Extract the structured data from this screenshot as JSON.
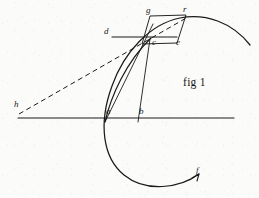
{
  "figure": {
    "caption": "fig 1",
    "ink_color": "#1a1a1a",
    "paper_color": "#fbfbfa",
    "width": 259,
    "height": 198,
    "points": [
      {
        "id": "h",
        "label": "h",
        "x": 18,
        "y": 113,
        "label_x": 14,
        "label_y": 104
      },
      {
        "id": "a",
        "label": "a",
        "x": 105,
        "y": 122,
        "label_x": 106,
        "label_y": 111
      },
      {
        "id": "b",
        "label": "b",
        "x": 138,
        "y": 122,
        "label_x": 139,
        "label_y": 111
      },
      {
        "id": "c",
        "label": "c",
        "x": 150,
        "y": 39,
        "label_x": 152,
        "label_y": 40
      },
      {
        "id": "d",
        "label": "d",
        "x": 112,
        "y": 37,
        "label_x": 105,
        "label_y": 30
      },
      {
        "id": "e",
        "label": "e",
        "x": 177,
        "y": 40,
        "label_x": 176,
        "label_y": 40
      },
      {
        "id": "g",
        "label": "g",
        "x": 150,
        "y": 16,
        "label_x": 146,
        "label_y": 9
      },
      {
        "id": "r",
        "label": "r",
        "x": 186,
        "y": 15,
        "label_x": 183,
        "label_y": 7
      },
      {
        "id": "f",
        "label": "f",
        "x": 198,
        "y": 175,
        "label_x": 196,
        "label_y": 168
      }
    ],
    "strokes": {
      "baseline": "M 18 118 L 234 118",
      "chord_ac": "M 105 122 L 153 24",
      "chord_bc": "M 138 122 L 150 39",
      "curve_ac": "M 105 122 C 111 96 126 62 151 38",
      "segment_dc": "M 112 37 L 177 37",
      "parallelogram_gree": "M 150 16 L 186 15 L 177 43 L 142 44 Z",
      "dashed_hr": "M 19 114 L 188 17",
      "arc_big": "M 250 45 C 232 22 205 13 180 18 C 150 24 124 52 112 86 C 98 124 103 158 124 175 C 146 193 180 188 199 174",
      "arrowhead_f": "M 199 174 L 192 178 M 199 174 L 197 181"
    },
    "stroke_widths": {
      "baseline": 1.1,
      "thin": 0.9,
      "curve": 1.2,
      "arc": 1.25,
      "dashed": 1.0
    },
    "dash_pattern": "5 3.5"
  }
}
